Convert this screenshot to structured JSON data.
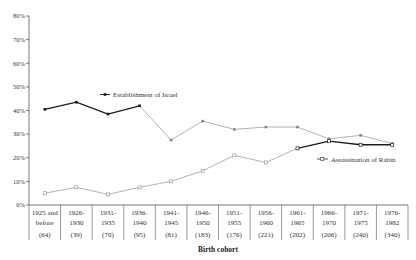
{
  "chart_data": {
    "type": "line",
    "title": "",
    "xlabel": "Birth cohort",
    "ylabel": "",
    "ylim": [
      0,
      80
    ],
    "yticks": [
      "0%",
      "10%",
      "20%",
      "30%",
      "40%",
      "50%",
      "60%",
      "70%",
      "80%"
    ],
    "grid": false,
    "legend_position": "inline labels",
    "categories": [
      {
        "line1": "1925 and",
        "line2": "before",
        "n": "(64)"
      },
      {
        "line1": "1926-",
        "line2": "1930",
        "n": "(39)"
      },
      {
        "line1": "1931-",
        "line2": "1935",
        "n": "(70)"
      },
      {
        "line1": "1936-",
        "line2": "1940",
        "n": "(95)"
      },
      {
        "line1": "1941-",
        "line2": "1945",
        "n": "(81)"
      },
      {
        "line1": "1946-",
        "line2": "1950",
        "n": "(183)"
      },
      {
        "line1": "1951-",
        "line2": "1955",
        "n": "(176)"
      },
      {
        "line1": "1956-",
        "line2": "1960",
        "n": "(221)"
      },
      {
        "line1": "1961-",
        "line2": "1965",
        "n": "(202)"
      },
      {
        "line1": "1966-",
        "line2": "1970",
        "n": "(206)"
      },
      {
        "line1": "1971-",
        "line2": "1975",
        "n": "(240)"
      },
      {
        "line1": "1976-",
        "line2": "1982",
        "n": "(340)"
      }
    ],
    "series": [
      {
        "name": "Establishment of Israel",
        "marker": "filled-square",
        "values": [
          40.5,
          43.5,
          38.5,
          42,
          27.5,
          35.5,
          32,
          33,
          33,
          28,
          29.5,
          26
        ]
      },
      {
        "name": "Assassination of Rabin",
        "marker": "open-square",
        "values": [
          5,
          7.5,
          4.5,
          7.5,
          10,
          14.5,
          21,
          18,
          24,
          27,
          25.5,
          25.5
        ]
      }
    ]
  },
  "colors": {
    "dark_line": "#1a1a1a",
    "light_line": "#aaaaaa",
    "axis": "#555555"
  }
}
